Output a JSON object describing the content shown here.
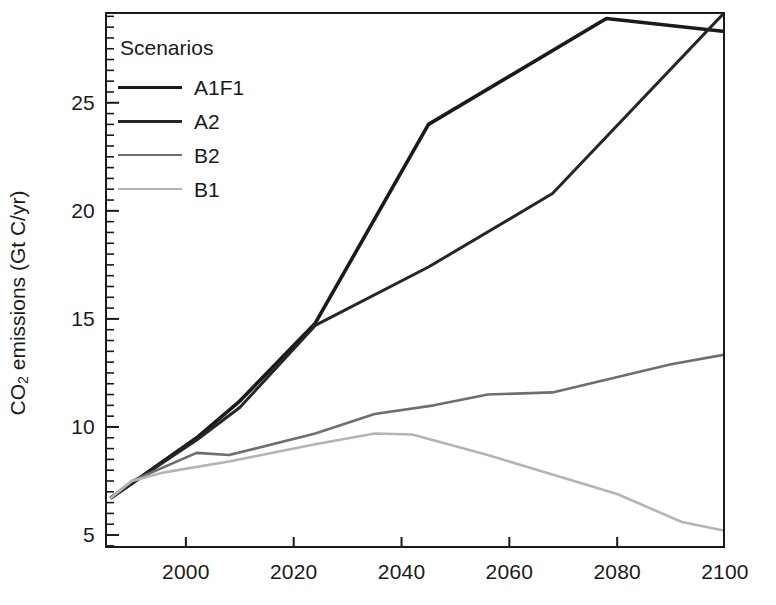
{
  "chart_data": {
    "type": "line",
    "title": "",
    "xlabel": "",
    "ylabel": "CO2 emissions (Gt C/yr)",
    "ylabel_prefix": "CO",
    "ylabel_sub": "2",
    "ylabel_suffix": " emissions (Gt C/yr)",
    "xlim": [
      1985,
      2100
    ],
    "ylim": [
      4.4,
      29.2
    ],
    "xticks": [
      2000,
      2020,
      2040,
      2060,
      2080,
      2100
    ],
    "yticks": [
      5,
      10,
      15,
      20,
      25
    ],
    "minor_yticks": [
      4.5,
      5.5,
      6,
      6.5,
      7,
      7.5,
      8,
      8.5,
      9,
      9.5,
      10.5,
      11,
      11.5,
      12,
      12.5,
      13,
      13.5,
      14,
      14.5,
      15.5,
      16,
      16.5,
      17,
      17.5,
      18,
      18.5,
      19,
      19.5,
      20.5,
      21,
      21.5,
      22,
      22.5,
      23,
      23.5,
      24,
      24.5,
      25.5,
      26,
      26.5,
      27,
      27.5,
      28,
      28.5,
      29
    ],
    "grid": false,
    "legend_position": "upper-left",
    "legend_title": "Scenarios",
    "series": [
      {
        "name": "A1F1",
        "color": "#1a1a1a",
        "width": 3.6,
        "x": [
          1986,
          1990,
          2002,
          2010,
          2024,
          2045,
          2078,
          2100
        ],
        "values": [
          6.7,
          7.4,
          9.5,
          11.2,
          14.8,
          24.0,
          28.9,
          28.3
        ]
      },
      {
        "name": "A2",
        "color": "#262626",
        "width": 3.0,
        "x": [
          1986,
          1990,
          2002,
          2010,
          2024,
          2045,
          2068,
          2100
        ],
        "values": [
          6.7,
          7.4,
          9.4,
          10.9,
          14.7,
          17.4,
          20.8,
          29.2
        ]
      },
      {
        "name": "B2",
        "color": "#6e6e6e",
        "width": 2.6,
        "x": [
          1986,
          1990,
          2002,
          2008,
          2024,
          2035,
          2046,
          2056,
          2068,
          2090,
          2100
        ],
        "values": [
          6.7,
          7.5,
          8.8,
          8.7,
          9.7,
          10.6,
          11.0,
          11.5,
          11.6,
          12.9,
          13.35
        ]
      },
      {
        "name": "B1",
        "color": "#b4b4b4",
        "width": 2.6,
        "x": [
          1986,
          1990,
          1996,
          2008,
          2024,
          2035,
          2042,
          2056,
          2080,
          2092,
          2100
        ],
        "values": [
          6.7,
          7.5,
          7.9,
          8.4,
          9.2,
          9.7,
          9.65,
          8.7,
          6.9,
          5.6,
          5.2
        ]
      }
    ]
  },
  "legend": {
    "title": "Scenarios",
    "entries": [
      {
        "label": "A1F1"
      },
      {
        "label": "A2"
      },
      {
        "label": "B2"
      },
      {
        "label": "B1"
      }
    ]
  },
  "axes": {
    "x_tick_labels": [
      "2000",
      "2020",
      "2040",
      "2060",
      "2080",
      "2100"
    ],
    "y_tick_labels": [
      "5",
      "10",
      "15",
      "20",
      "25"
    ]
  }
}
